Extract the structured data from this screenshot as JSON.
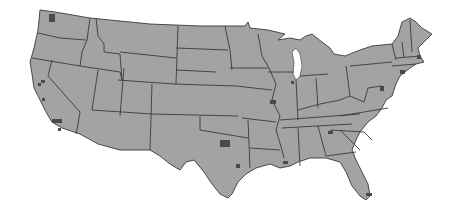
{
  "map": {
    "type": "choropleth-outline",
    "region": "Contiguous United States",
    "title": "",
    "colors": {
      "land": "#a3a3a3",
      "border": "#3a3a3a",
      "urban_marker": "#4a4a4a",
      "water": "#ffffff"
    },
    "legend": null,
    "urban_markers": [
      {
        "name": "seattle",
        "x": 52,
        "y": 18
      },
      {
        "name": "sf-bay",
        "x": 40,
        "y": 82
      },
      {
        "name": "sacramento",
        "x": 44,
        "y": 77
      },
      {
        "name": "fresno",
        "x": 45,
        "y": 101
      },
      {
        "name": "los-angeles",
        "x": 55,
        "y": 117
      },
      {
        "name": "san-diego",
        "x": 56,
        "y": 130
      },
      {
        "name": "dallas",
        "x": 225,
        "y": 143
      },
      {
        "name": "houston",
        "x": 238,
        "y": 165
      },
      {
        "name": "new-orleans",
        "x": 285,
        "y": 162
      },
      {
        "name": "st-louis",
        "x": 273,
        "y": 102
      },
      {
        "name": "chicago",
        "x": 292,
        "y": 83
      },
      {
        "name": "atlanta",
        "x": 330,
        "y": 133
      },
      {
        "name": "miami",
        "x": 370,
        "y": 195
      },
      {
        "name": "dc-baltimore",
        "x": 382,
        "y": 88
      },
      {
        "name": "new-york",
        "x": 403,
        "y": 73
      },
      {
        "name": "boston",
        "x": 419,
        "y": 57
      }
    ]
  }
}
